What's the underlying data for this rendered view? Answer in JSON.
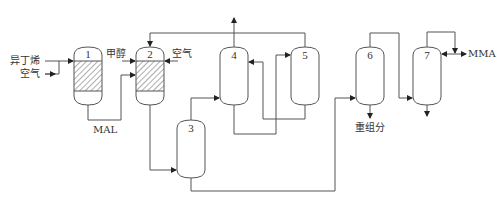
{
  "diagram": {
    "type": "process-flow",
    "colors": {
      "line": "#555555",
      "hatch": "#777777",
      "text": "#333333",
      "background": "#ffffff"
    },
    "vessels": [
      {
        "id": "1",
        "label": "1",
        "packed": true
      },
      {
        "id": "2",
        "label": "2",
        "packed": true
      },
      {
        "id": "3",
        "label": "3",
        "packed": false
      },
      {
        "id": "4",
        "label": "4",
        "packed": false
      },
      {
        "id": "5",
        "label": "5",
        "packed": false
      },
      {
        "id": "6",
        "label": "6",
        "packed": false
      },
      {
        "id": "7",
        "label": "7",
        "packed": false
      }
    ],
    "streams": {
      "isobutylene": "异丁烯",
      "air_1": "空气",
      "methanol": "甲醇",
      "air_2": "空气",
      "mal": "MAL",
      "heavy": "重组分",
      "product": "MMA"
    }
  }
}
